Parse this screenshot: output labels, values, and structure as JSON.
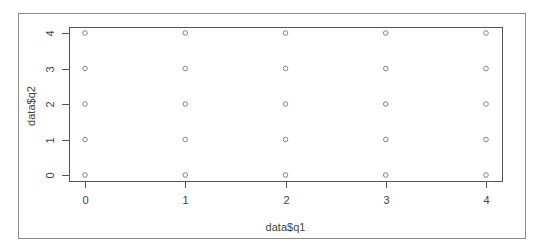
{
  "chart_data": {
    "type": "scatter",
    "title": "",
    "xlabel": "data$q1",
    "ylabel": "data$q2",
    "xlim": [
      0,
      4
    ],
    "ylim": [
      0,
      4
    ],
    "x_ticks": [
      0,
      1,
      2,
      3,
      4
    ],
    "y_ticks": [
      0,
      1,
      2,
      3,
      4
    ],
    "x_tick_labels": [
      "0",
      "1",
      "2",
      "3",
      "4"
    ],
    "y_tick_labels": [
      "0",
      "1",
      "2",
      "3",
      "4"
    ],
    "grid": false,
    "legend": null,
    "marker": "open-circle",
    "colors": {
      "points": "#777777",
      "axis": "#555555",
      "text": "#444444",
      "frame": "#8a8a8a"
    },
    "series": [
      {
        "name": "data",
        "points": [
          {
            "x": 0,
            "y": 0
          },
          {
            "x": 0,
            "y": 1
          },
          {
            "x": 0,
            "y": 2
          },
          {
            "x": 0,
            "y": 3
          },
          {
            "x": 0,
            "y": 4
          },
          {
            "x": 1,
            "y": 0
          },
          {
            "x": 1,
            "y": 1
          },
          {
            "x": 1,
            "y": 2
          },
          {
            "x": 1,
            "y": 3
          },
          {
            "x": 1,
            "y": 4
          },
          {
            "x": 2,
            "y": 0
          },
          {
            "x": 2,
            "y": 1
          },
          {
            "x": 2,
            "y": 2
          },
          {
            "x": 2,
            "y": 3
          },
          {
            "x": 2,
            "y": 4
          },
          {
            "x": 3,
            "y": 0
          },
          {
            "x": 3,
            "y": 1
          },
          {
            "x": 3,
            "y": 2
          },
          {
            "x": 3,
            "y": 3
          },
          {
            "x": 3,
            "y": 4
          },
          {
            "x": 4,
            "y": 0
          },
          {
            "x": 4,
            "y": 1
          },
          {
            "x": 4,
            "y": 2
          },
          {
            "x": 4,
            "y": 3
          },
          {
            "x": 4,
            "y": 4
          }
        ]
      }
    ]
  }
}
